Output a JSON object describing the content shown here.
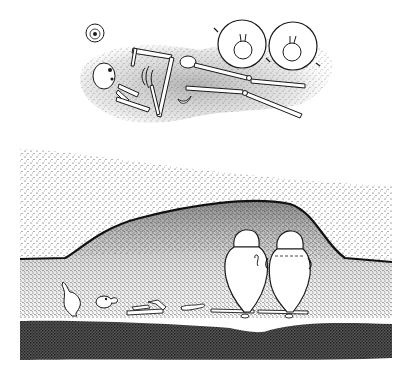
{
  "figure": {
    "plan_view": {
      "label": "Plan view of skeleton with two jars and small vessel",
      "items": [
        "skull",
        "ribcage",
        "arm bones",
        "pelvis",
        "leg bones",
        "jar left (top view)",
        "jar right (top view)",
        "small vessel (top view)"
      ]
    },
    "section_view": {
      "label": "Section view of burial mound with jars and skeleton",
      "items": [
        "topsoil layer",
        "mound fill",
        "burial pit",
        "base layer",
        "small jug",
        "skull",
        "scattered bones",
        "jar left",
        "jar right"
      ]
    }
  },
  "colors": {
    "background": "#ffffff",
    "ink": "#1a1a1a",
    "stipple_light": "#b8b8b8",
    "stipple_mid": "#6e6e6e",
    "stipple_dark": "#2e2e2e"
  }
}
